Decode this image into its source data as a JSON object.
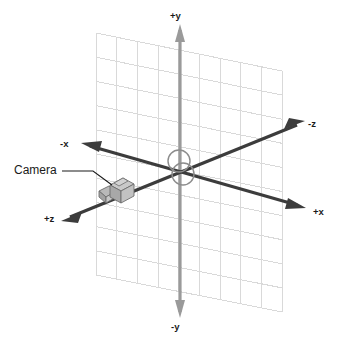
{
  "diagram": {
    "type": "3d-axis-diagram",
    "background_color": "#ffffff",
    "labels": {
      "positive_y": "+y",
      "negative_y": "-y",
      "positive_x": "+x",
      "negative_x": "-x",
      "positive_z": "+z",
      "negative_z": "-z",
      "camera": "Camera"
    },
    "colors": {
      "grid": "#d9d9d9",
      "y_axis": "#9a9a9a",
      "xz_axis": "#3c3c3c",
      "origin_circle": "#8c8c8c",
      "camera_body": "#b4b4b4",
      "camera_outline": "#666666",
      "text": "#1a1a1a",
      "leader_line": "#1a1a1a"
    },
    "elements": {
      "grid_plane": "grid-plane",
      "y_axis": "y-axis",
      "x_axis": "x-axis",
      "z_axis": "z-axis",
      "origin_marker": "origin-circles",
      "camera_object": "camera-icon",
      "camera_leader": "camera-leader-line"
    },
    "grid": {
      "columns": 9,
      "rows": 10
    }
  }
}
